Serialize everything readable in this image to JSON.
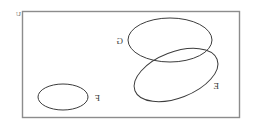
{
  "canvas": {
    "width": 257,
    "height": 127,
    "background": "#ffffff"
  },
  "diagram": {
    "type": "venn-set-diagram",
    "orientation": "horizontally-mirrored",
    "title": "",
    "stroke_color": "#3c3c3c",
    "frame_color": "#8c8c8c",
    "label_color": "#3a3a3a"
  },
  "universe": {
    "label": "U",
    "shape": "rectangle",
    "x": 22,
    "y": 11,
    "width": 218,
    "height": 107,
    "label_x": 16,
    "label_y": 14
  },
  "sets": [
    {
      "id": "set-f",
      "label": "F",
      "shape": "ellipse",
      "cx": 63,
      "cy": 97,
      "rx": 25,
      "ry": 13,
      "rotation": 0,
      "label_x": 95,
      "label_y": 101,
      "overlaps": []
    },
    {
      "id": "set-g",
      "label": "G",
      "shape": "ellipse",
      "cx": 170,
      "cy": 40,
      "rx": 42,
      "ry": 22,
      "rotation": 0,
      "label_x": 116,
      "label_y": 44,
      "overlaps": [
        "set-e"
      ]
    },
    {
      "id": "set-e",
      "label": "E",
      "shape": "ellipse",
      "cx": 176,
      "cy": 75,
      "rx": 44,
      "ry": 23,
      "rotation": -21,
      "label_x": 213,
      "label_y": 89,
      "overlaps": [
        "set-g"
      ]
    }
  ],
  "regions": {
    "intersection": "G ∩ E",
    "disjoint": "F"
  }
}
